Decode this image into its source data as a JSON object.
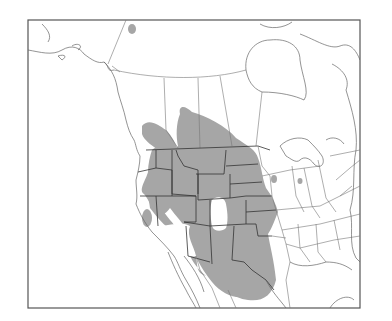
{
  "map": {
    "type": "species-range-map",
    "region": "Western and central North America",
    "colors": {
      "background": "#ffffff",
      "range_fill": "#a6a6a6",
      "boundary_lines": "#666666",
      "frame": "#555555"
    },
    "legend": null,
    "labels": []
  }
}
